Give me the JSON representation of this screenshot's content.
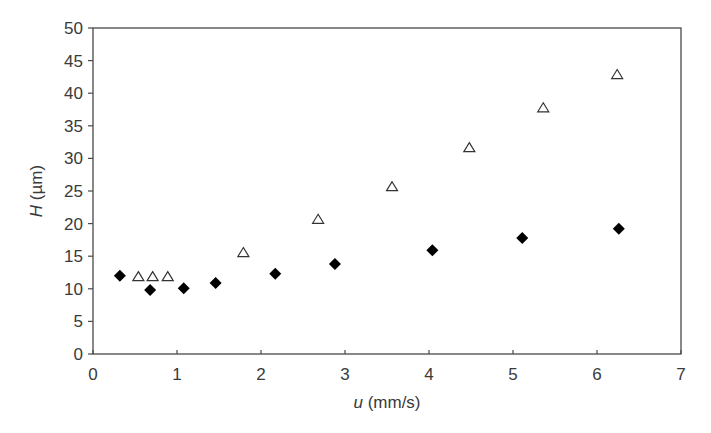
{
  "chart_data": {
    "type": "scatter",
    "title": "",
    "xlabel": "u (mm/s)",
    "xlabel_italic_part": "u",
    "xlabel_rest": " (mm/s)",
    "ylabel": "H (µm)",
    "ylabel_italic_part": "H",
    "ylabel_rest": " (µm)",
    "xlim": [
      0,
      7
    ],
    "ylim": [
      0,
      50
    ],
    "xticks": [
      0,
      1,
      2,
      3,
      4,
      5,
      6,
      7
    ],
    "yticks": [
      0,
      5,
      10,
      15,
      20,
      25,
      30,
      35,
      40,
      45,
      50
    ],
    "grid": false,
    "legend": null,
    "series": [
      {
        "name": "filled diamonds",
        "marker": "diamond",
        "filled": true,
        "color": "#000000",
        "x": [
          0.32,
          0.68,
          1.08,
          1.46,
          2.17,
          2.88,
          4.04,
          5.11,
          6.26
        ],
        "y": [
          12.0,
          9.8,
          10.1,
          10.9,
          12.3,
          13.8,
          15.9,
          17.8,
          19.2
        ]
      },
      {
        "name": "open triangles",
        "marker": "triangle",
        "filled": false,
        "color": "#333333",
        "x": [
          0.54,
          0.71,
          0.89,
          1.79,
          2.68,
          3.56,
          4.48,
          5.36,
          6.24
        ],
        "y": [
          11.8,
          11.8,
          11.8,
          15.5,
          20.6,
          25.6,
          31.6,
          37.7,
          42.8
        ]
      }
    ]
  }
}
